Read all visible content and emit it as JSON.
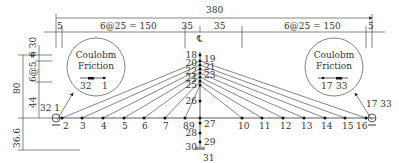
{
  "diagram": {
    "type": "cable-stayed-bridge-model",
    "dimensions": {
      "total_span": "380",
      "left_edge": "5",
      "left_cables": "6@25 = 150",
      "center_left": "35",
      "center_right": "35",
      "right_cables": "6@25 = 150",
      "right_edge": "5",
      "centerline_symbol": "℄",
      "tower_height_total": "80",
      "tower_top": "6",
      "tower_anchor_spacing": "6@5 = 30",
      "tower_below_anchor": "44",
      "tower_below_deck": "36.6"
    },
    "insets": [
      {
        "title_line1": "Coulobm",
        "title_line2": "Friction",
        "nodes": [
          "32",
          "1"
        ]
      },
      {
        "title_line1": "Coulobm",
        "title_line2": "Friction",
        "nodes": [
          "17",
          "33"
        ]
      }
    ],
    "deck_nodes": [
      "2",
      "3",
      "4",
      "5",
      "6",
      "7",
      "8",
      "9",
      "10",
      "11",
      "12",
      "13",
      "14",
      "15",
      "16"
    ],
    "end_labels": {
      "left": "32 1",
      "right": "17 33"
    },
    "tower_nodes_left": [
      "18",
      "20",
      "22",
      "24",
      "25",
      "26"
    ],
    "tower_nodes_right": [
      "19",
      "21",
      "23"
    ],
    "below_deck_nodes": {
      "n27": "27",
      "n28": "28",
      "n29": "29",
      "n30": "30",
      "n31": "31"
    }
  }
}
